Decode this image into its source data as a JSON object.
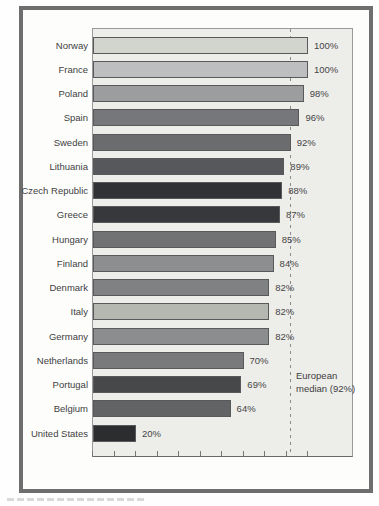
{
  "chart_data": {
    "type": "bar",
    "orientation": "horizontal",
    "title": "",
    "xlabel": "",
    "ylabel": "",
    "categories": [
      "Norway",
      "France",
      "Poland",
      "Spain",
      "Sweden",
      "Lithuania",
      "Czech Republic",
      "Greece",
      "Hungary",
      "Finland",
      "Denmark",
      "Italy",
      "Germany",
      "Netherlands",
      "Portugal",
      "Belgium",
      "United States"
    ],
    "values": [
      100,
      100,
      98,
      96,
      92,
      89,
      88,
      87,
      85,
      84,
      82,
      82,
      82,
      70,
      69,
      64,
      20
    ],
    "value_labels": [
      "100%",
      "100%",
      "98%",
      "96%",
      "92%",
      "89%",
      "88%",
      "87%",
      "85%",
      "84%",
      "82%",
      "82%",
      "82%",
      "70%",
      "69%",
      "64%",
      "20%"
    ],
    "bar_colors": [
      "#d2d4ce",
      "#bcbec0",
      "#9b9d9f",
      "#75777b",
      "#6a6c6e",
      "#56585c",
      "#303236",
      "#36383c",
      "#707274",
      "#8c8e90",
      "#7f8183",
      "#b5b7b1",
      "#8b8d8f",
      "#787a7c",
      "#46484a",
      "#616365",
      "#2b2d2f"
    ],
    "xlim": [
      0,
      100
    ],
    "x_ticks": [
      0,
      10,
      20,
      30,
      40,
      50,
      60,
      70,
      80,
      90,
      100
    ],
    "x_tick_labels_visible": false,
    "grid": false,
    "legend": "none",
    "reference_line": {
      "value": 92,
      "style": "dashed",
      "label": "European median (92%)"
    }
  },
  "annotations": {
    "median_label_line1": "European",
    "median_label_line2": "median (92%)"
  },
  "colors": {
    "frame_border": "#6e6e6e",
    "plot_background": "#ededea",
    "plot_border": "#9a9a9a",
    "axis_line": "#6a6a6a",
    "bar_outline": "#59595b",
    "median_line": "#8a8a8a",
    "text": "#414141",
    "page_background": "#fefefe"
  }
}
